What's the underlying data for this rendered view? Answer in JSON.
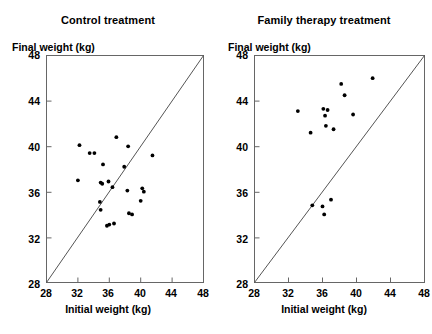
{
  "chart_data": [
    {
      "type": "scatter",
      "title": "Control treatment",
      "xlabel": "Initial weight (kg)",
      "ylabel": "Final weight (kg)",
      "xlim": [
        28,
        48
      ],
      "ylim": [
        28,
        48
      ],
      "xticks": [
        28,
        32,
        36,
        40,
        44,
        48
      ],
      "yticks": [
        28,
        32,
        36,
        40,
        44,
        48
      ],
      "grid": false,
      "legend": "none",
      "reference_line": {
        "name": "identity-line",
        "from": [
          28,
          28
        ],
        "to": [
          48,
          48
        ]
      },
      "points": [
        [
          32.2,
          40.1
        ],
        [
          33.5,
          39.4
        ],
        [
          34.1,
          39.4
        ],
        [
          35.2,
          38.4
        ],
        [
          32.0,
          37.0
        ],
        [
          34.9,
          36.8
        ],
        [
          35.1,
          36.7
        ],
        [
          35.9,
          36.9
        ],
        [
          36.4,
          36.4
        ],
        [
          36.9,
          40.8
        ],
        [
          38.4,
          40.0
        ],
        [
          37.9,
          38.2
        ],
        [
          38.3,
          36.1
        ],
        [
          40.2,
          36.3
        ],
        [
          40.4,
          36.0
        ],
        [
          40.0,
          35.2
        ],
        [
          41.5,
          39.2
        ],
        [
          34.8,
          35.1
        ],
        [
          34.9,
          34.4
        ],
        [
          35.7,
          33.0
        ],
        [
          36.0,
          33.1
        ],
        [
          38.5,
          34.1
        ],
        [
          38.9,
          34.0
        ],
        [
          36.6,
          33.2
        ]
      ]
    },
    {
      "type": "scatter",
      "title": "Family therapy treatment",
      "xlabel": "Initial weight (kg)",
      "ylabel": "Final weight (kg)",
      "xlim": [
        28,
        48
      ],
      "ylim": [
        28,
        48
      ],
      "xticks": [
        28,
        32,
        36,
        40,
        44,
        48
      ],
      "yticks": [
        28,
        32,
        36,
        40,
        44,
        48
      ],
      "grid": false,
      "legend": "none",
      "reference_line": {
        "name": "identity-line",
        "from": [
          28,
          28
        ],
        "to": [
          48,
          48
        ]
      },
      "points": [
        [
          33.1,
          43.1
        ],
        [
          34.6,
          41.2
        ],
        [
          36.1,
          43.3
        ],
        [
          36.6,
          43.2
        ],
        [
          36.3,
          42.7
        ],
        [
          36.4,
          41.8
        ],
        [
          37.3,
          41.5
        ],
        [
          38.2,
          45.5
        ],
        [
          38.6,
          44.5
        ],
        [
          39.6,
          42.8
        ],
        [
          41.9,
          46.0
        ],
        [
          34.8,
          34.8
        ],
        [
          36.0,
          34.7
        ],
        [
          37.0,
          35.3
        ],
        [
          36.2,
          34.0
        ]
      ]
    }
  ],
  "panels": [
    {
      "name": "control-panel",
      "title": "Control treatment",
      "ylabel": "Final weight (kg)",
      "xlabel": "Initial weight (kg)",
      "ytick_labels": [
        "48",
        "44",
        "40",
        "36",
        "32",
        "28"
      ],
      "xtick_labels": [
        "28",
        "32",
        "36",
        "40",
        "44",
        "48"
      ]
    },
    {
      "name": "family-therapy-panel",
      "title": "Family therapy treatment",
      "ylabel": "Final weight (kg)",
      "xlabel": "Initial weight (kg)",
      "ytick_labels": [
        "48",
        "44",
        "40",
        "36",
        "32",
        "28"
      ],
      "xtick_labels": [
        "28",
        "32",
        "36",
        "40",
        "44",
        "48"
      ]
    }
  ],
  "style": {
    "point_color": "#000000",
    "axis_color": "#555555",
    "line_color": "#444444",
    "background": "#ffffff"
  }
}
